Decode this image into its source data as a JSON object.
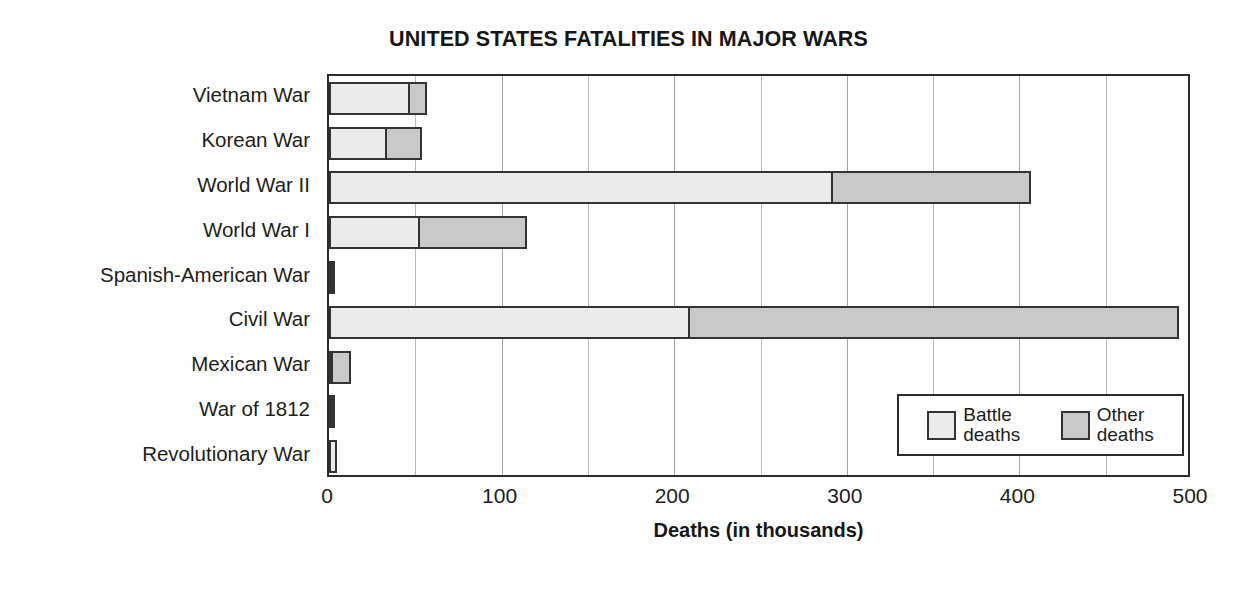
{
  "chart_data": {
    "type": "bar",
    "orientation": "horizontal",
    "stacked": true,
    "title": "UNITED STATES FATALITIES IN MAJOR WARS",
    "xlabel": "Deaths (in thousands)",
    "ylabel": "",
    "xlim": [
      0,
      500
    ],
    "xticks": [
      0,
      100,
      200,
      300,
      400,
      500
    ],
    "xticklabels": [
      "0",
      "100",
      "200",
      "300",
      "400",
      "500"
    ],
    "minor_gridline_step": 50,
    "grid": true,
    "legend_position": "inside-lower-right",
    "categories": [
      "Vietnam War",
      "Korean War",
      "World War II",
      "World War I",
      "Spanish-American War",
      "Civil War",
      "Mexican War",
      "War of 1812",
      "Revolutionary War"
    ],
    "series": [
      {
        "name": "Battle deaths",
        "legend_line1": "Battle",
        "legend_line2": "deaths",
        "color": "#ebebeb",
        "values": [
          47,
          34,
          292,
          53,
          0.4,
          209,
          1.7,
          2.3,
          4.4
        ]
      },
      {
        "name": "Other deaths",
        "legend_line1": "Other",
        "legend_line2": "deaths",
        "color": "#c9c9c9",
        "values": [
          11,
          21,
          116,
          63,
          1.7,
          285,
          11.6,
          2.0,
          0.0
        ]
      }
    ],
    "totals": [
      58,
      55,
      408,
      116,
      2.1,
      494,
      13.3,
      4.3,
      4.4
    ]
  },
  "colors": {
    "battle_fill": "#ebebeb",
    "other_fill": "#c9c9c9",
    "outline": "#333333",
    "axis": "#2b2b2b",
    "gridline": "#b9b9b9",
    "text": "#1c1c1c",
    "background": "#ffffff"
  }
}
